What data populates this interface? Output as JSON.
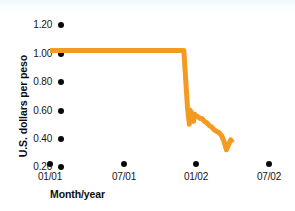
{
  "chart_data": {
    "type": "line",
    "title": "",
    "xlabel": "Month/year",
    "ylabel": "U.S. dollars per peso",
    "xlim": [
      0,
      19
    ],
    "ylim": [
      0.2,
      1.2
    ],
    "grid": false,
    "legend": null,
    "line_color": "#F59A20",
    "x_tick_labels": [
      "01/01",
      "07/01",
      "01/02",
      "07/02"
    ],
    "x_tick_positions": [
      0,
      6,
      12,
      18
    ],
    "y_tick_labels": [
      "1.20",
      "1.00",
      "0.80",
      "0.60",
      "0.40",
      "0.20"
    ],
    "y_tick_values": [
      1.2,
      1.0,
      0.8,
      0.6,
      0.4,
      0.2
    ],
    "series": [
      {
        "name": "U.S. dollars per peso",
        "x": [
          0.0,
          1.0,
          2.0,
          3.0,
          4.0,
          5.0,
          6.0,
          7.0,
          8.0,
          9.0,
          10.0,
          11.0,
          11.3,
          11.45,
          11.5,
          11.65,
          11.8,
          11.9,
          12.0,
          12.2,
          12.35,
          12.5,
          12.7,
          12.9,
          13.1,
          13.3,
          13.5,
          13.7,
          13.9,
          14.1,
          14.3,
          14.5,
          14.7,
          14.85,
          15.0
        ],
        "y": [
          1.0,
          1.0,
          1.0,
          1.0,
          1.0,
          1.0,
          1.0,
          1.0,
          1.0,
          1.0,
          1.0,
          1.0,
          0.6,
          0.48,
          0.58,
          0.56,
          0.5,
          0.55,
          0.54,
          0.53,
          0.52,
          0.52,
          0.5,
          0.49,
          0.47,
          0.46,
          0.44,
          0.43,
          0.42,
          0.4,
          0.36,
          0.3,
          0.34,
          0.37,
          0.35
        ]
      }
    ],
    "annotations": []
  },
  "ticks": {
    "y": [
      {
        "label": "1.20",
        "top": 19
      },
      {
        "label": "1.00",
        "top": 48
      },
      {
        "label": "0.80",
        "top": 76
      },
      {
        "label": "0.60",
        "top": 105
      },
      {
        "label": "0.40",
        "top": 133
      },
      {
        "label": "0.20",
        "top": 161
      }
    ],
    "x": [
      {
        "label": "01/01",
        "left": 15
      },
      {
        "label": "07/01",
        "left": 89
      },
      {
        "label": "01/02",
        "left": 161
      },
      {
        "label": "07/02",
        "left": 234
      }
    ]
  },
  "axis_titles": {
    "x": "Month/year",
    "y": "U.S. dollars per peso"
  }
}
